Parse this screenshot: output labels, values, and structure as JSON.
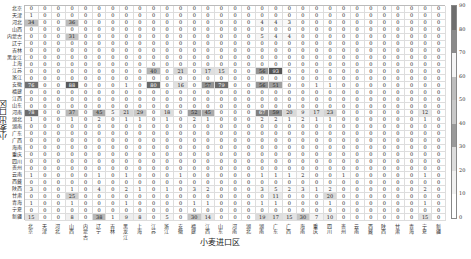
{
  "chart_data": {
    "type": "heatmap",
    "title": "",
    "xlabel": "小麦进口区",
    "ylabel": "小麦出口区",
    "provinces": [
      "北京",
      "天津",
      "河北",
      "山西",
      "内蒙古",
      "辽宁",
      "吉林",
      "黑龙江",
      "上海",
      "江苏",
      "浙江",
      "安徽",
      "福建",
      "江西",
      "山东",
      "河南",
      "湖北",
      "湖南",
      "广东",
      "广西",
      "海南",
      "重庆",
      "四川",
      "贵州",
      "云南",
      "西藏",
      "陕西",
      "甘肃",
      "青海",
      "宁夏",
      "新疆"
    ],
    "x_categories": [
      "北京",
      "天津",
      "河北",
      "山西",
      "内蒙古",
      "辽宁",
      "吉林",
      "黑龙江",
      "上海",
      "江苏",
      "浙江",
      "安徽",
      "福建",
      "江西",
      "山东",
      "河南",
      "湖北",
      "湖南",
      "广东",
      "广西",
      "海南",
      "重庆",
      "四川",
      "贵州",
      "云南",
      "西藏",
      "陕西",
      "甘肃",
      "青海",
      "宁夏",
      "新疆"
    ],
    "y_categories": [
      "北京",
      "天津",
      "河北",
      "山西",
      "内蒙古",
      "辽宁",
      "吉林",
      "黑龙江",
      "上海",
      "江苏",
      "浙江",
      "安徽",
      "福建",
      "江西",
      "山东",
      "河南",
      "湖北",
      "湖南",
      "广东",
      "广西",
      "海南",
      "重庆",
      "四川",
      "贵州",
      "云南",
      "西藏",
      "陕西",
      "甘肃",
      "青海",
      "宁夏",
      "新疆"
    ],
    "colorbar": {
      "min": 0,
      "max": 90,
      "ticks": [
        0,
        10,
        20,
        30,
        40,
        50,
        60,
        70,
        80,
        90
      ]
    },
    "values": [
      [
        0,
        0,
        0,
        0,
        0,
        0,
        0,
        0,
        0,
        0,
        0,
        0,
        0,
        0,
        0,
        0,
        0,
        0,
        0,
        0,
        0,
        0,
        0,
        0,
        0,
        0,
        0,
        0,
        0,
        0,
        0
      ],
      [
        1,
        0,
        0,
        0,
        0,
        0,
        0,
        0,
        0,
        0,
        0,
        0,
        0,
        0,
        0,
        0,
        0,
        0,
        0,
        0,
        0,
        0,
        0,
        0,
        0,
        0,
        0,
        0,
        0,
        0,
        0
      ],
      [
        34,
        0,
        0,
        36,
        0,
        0,
        0,
        0,
        0,
        0,
        0,
        0,
        0,
        0,
        0,
        0,
        0,
        4,
        4,
        3,
        0,
        0,
        0,
        0,
        0,
        0,
        0,
        0,
        0,
        0,
        0
      ],
      [
        0,
        0,
        0,
        0,
        0,
        0,
        0,
        0,
        0,
        0,
        0,
        0,
        0,
        0,
        0,
        0,
        0,
        0,
        0,
        0,
        0,
        0,
        0,
        0,
        0,
        0,
        0,
        0,
        0,
        0,
        0
      ],
      [
        0,
        0,
        0,
        31,
        0,
        0,
        0,
        0,
        0,
        0,
        0,
        0,
        0,
        0,
        0,
        0,
        0,
        5,
        4,
        4,
        0,
        0,
        0,
        0,
        0,
        0,
        0,
        0,
        0,
        0,
        0
      ],
      [
        0,
        0,
        0,
        0,
        0,
        0,
        0,
        0,
        0,
        0,
        0,
        0,
        0,
        0,
        0,
        0,
        0,
        0,
        0,
        0,
        0,
        0,
        0,
        0,
        0,
        0,
        0,
        0,
        0,
        0,
        0
      ],
      [
        0,
        0,
        0,
        0,
        0,
        0,
        0,
        0,
        0,
        0,
        0,
        0,
        0,
        0,
        0,
        0,
        0,
        0,
        0,
        0,
        0,
        0,
        0,
        0,
        0,
        0,
        0,
        0,
        0,
        0,
        0
      ],
      [
        0,
        0,
        0,
        0,
        0,
        0,
        0,
        0,
        0,
        0,
        0,
        0,
        0,
        0,
        0,
        0,
        0,
        0,
        0,
        0,
        0,
        0,
        0,
        0,
        0,
        0,
        0,
        0,
        0,
        0,
        0
      ],
      [
        0,
        0,
        0,
        0,
        0,
        0,
        0,
        0,
        0,
        0,
        0,
        0,
        0,
        0,
        0,
        0,
        0,
        0,
        0,
        0,
        0,
        0,
        0,
        0,
        0,
        0,
        0,
        0,
        0,
        0,
        0
      ],
      [
        0,
        0,
        0,
        0,
        0,
        0,
        0,
        0,
        0,
        40,
        0,
        21,
        0,
        17,
        15,
        0,
        0,
        56,
        93,
        0,
        0,
        0,
        0,
        0,
        0,
        0,
        0,
        0,
        0,
        0,
        0
      ],
      [
        0,
        0,
        0,
        0,
        0,
        0,
        0,
        0,
        0,
        0,
        0,
        0,
        0,
        0,
        0,
        0,
        0,
        0,
        0,
        0,
        0,
        0,
        0,
        0,
        0,
        0,
        0,
        0,
        0,
        0,
        0
      ],
      [
        76,
        0,
        0,
        88,
        0,
        0,
        0,
        1,
        0,
        80,
        0,
        16,
        0,
        57,
        79,
        0,
        0,
        56,
        51,
        0,
        0,
        1,
        1,
        0,
        0,
        0,
        0,
        0,
        0,
        0,
        0
      ],
      [
        0,
        0,
        0,
        0,
        0,
        0,
        0,
        0,
        0,
        0,
        0,
        0,
        0,
        0,
        0,
        0,
        0,
        0,
        0,
        0,
        0,
        0,
        0,
        0,
        0,
        0,
        0,
        0,
        0,
        0,
        0
      ],
      [
        0,
        0,
        0,
        0,
        0,
        0,
        0,
        0,
        0,
        0,
        0,
        0,
        0,
        0,
        0,
        0,
        0,
        0,
        0,
        0,
        0,
        0,
        0,
        0,
        0,
        0,
        0,
        0,
        0,
        0,
        0
      ],
      [
        0,
        0,
        0,
        0,
        0,
        0,
        0,
        0,
        0,
        0,
        0,
        0,
        0,
        0,
        0,
        0,
        0,
        0,
        0,
        0,
        0,
        0,
        0,
        0,
        0,
        0,
        0,
        0,
        0,
        0,
        0
      ],
      [
        78,
        0,
        0,
        37,
        0,
        45,
        5,
        21,
        29,
        0,
        18,
        0,
        52,
        45,
        0,
        0,
        0,
        67,
        59,
        20,
        9,
        17,
        23,
        0,
        0,
        0,
        0,
        0,
        0,
        12,
        0
      ],
      [
        1,
        0,
        0,
        1,
        0,
        2,
        0,
        1,
        1,
        0,
        1,
        0,
        2,
        1,
        0,
        0,
        0,
        2,
        2,
        1,
        2,
        1,
        1,
        0,
        0,
        0,
        0,
        0,
        0,
        1,
        0
      ],
      [
        0,
        0,
        0,
        0,
        0,
        0,
        0,
        0,
        0,
        0,
        0,
        0,
        0,
        0,
        0,
        0,
        0,
        0,
        0,
        0,
        0,
        0,
        0,
        0,
        0,
        0,
        0,
        0,
        0,
        0,
        0
      ],
      [
        0,
        0,
        0,
        0,
        0,
        0,
        0,
        0,
        0,
        0,
        0,
        0,
        0,
        0,
        0,
        0,
        0,
        0,
        0,
        0,
        0,
        0,
        0,
        0,
        0,
        0,
        0,
        0,
        0,
        0,
        0
      ],
      [
        0,
        0,
        0,
        0,
        0,
        0,
        0,
        0,
        0,
        0,
        0,
        0,
        0,
        0,
        0,
        0,
        0,
        0,
        0,
        0,
        0,
        0,
        0,
        0,
        0,
        0,
        0,
        0,
        0,
        0,
        0
      ],
      [
        0,
        0,
        0,
        0,
        0,
        0,
        0,
        0,
        0,
        0,
        0,
        0,
        0,
        0,
        0,
        0,
        0,
        0,
        0,
        0,
        0,
        0,
        0,
        0,
        0,
        0,
        0,
        0,
        0,
        0,
        0
      ],
      [
        0,
        0,
        0,
        0,
        0,
        0,
        0,
        0,
        0,
        0,
        0,
        0,
        0,
        0,
        0,
        0,
        0,
        0,
        0,
        0,
        0,
        0,
        0,
        0,
        0,
        0,
        0,
        0,
        0,
        0,
        0
      ],
      [
        0,
        0,
        0,
        0,
        0,
        0,
        0,
        0,
        0,
        0,
        0,
        0,
        0,
        0,
        0,
        0,
        0,
        0,
        0,
        0,
        0,
        0,
        0,
        0,
        0,
        0,
        0,
        0,
        0,
        0,
        0
      ],
      [
        0,
        0,
        0,
        0,
        0,
        0,
        0,
        0,
        0,
        0,
        0,
        0,
        0,
        0,
        0,
        0,
        0,
        0,
        0,
        0,
        0,
        0,
        0,
        0,
        0,
        0,
        0,
        0,
        0,
        0,
        0
      ],
      [
        1,
        0,
        0,
        0,
        0,
        1,
        0,
        1,
        0,
        0,
        0,
        1,
        0,
        0,
        0,
        0,
        0,
        1,
        1,
        1,
        2,
        0,
        0,
        1,
        0,
        0,
        0,
        0,
        0,
        1,
        0
      ],
      [
        0,
        0,
        0,
        0,
        0,
        0,
        0,
        0,
        0,
        0,
        0,
        0,
        0,
        0,
        0,
        0,
        0,
        0,
        0,
        0,
        0,
        0,
        0,
        0,
        0,
        0,
        0,
        0,
        0,
        0,
        0
      ],
      [
        3,
        0,
        0,
        1,
        0,
        4,
        0,
        2,
        1,
        0,
        1,
        0,
        3,
        2,
        0,
        0,
        0,
        3,
        5,
        2,
        3,
        1,
        2,
        0,
        0,
        0,
        0,
        0,
        0,
        2,
        0
      ],
      [
        0,
        0,
        0,
        25,
        0,
        0,
        0,
        0,
        0,
        0,
        0,
        0,
        0,
        0,
        0,
        0,
        0,
        0,
        11,
        0,
        0,
        0,
        20,
        0,
        0,
        0,
        0,
        0,
        0,
        0,
        0
      ],
      [
        1,
        0,
        0,
        1,
        0,
        0,
        0,
        1,
        0,
        0,
        0,
        0,
        1,
        1,
        0,
        0,
        0,
        1,
        1,
        0,
        0,
        0,
        1,
        0,
        0,
        0,
        0,
        0,
        0,
        1,
        0
      ],
      [
        0,
        0,
        0,
        0,
        0,
        0,
        0,
        0,
        0,
        0,
        0,
        0,
        0,
        0,
        0,
        0,
        0,
        0,
        0,
        0,
        0,
        0,
        0,
        0,
        0,
        0,
        0,
        0,
        0,
        0,
        0
      ],
      [
        15,
        0,
        0,
        8,
        0,
        38,
        1,
        9,
        8,
        0,
        5,
        0,
        30,
        14,
        0,
        0,
        0,
        19,
        17,
        15,
        30,
        7,
        10,
        0,
        0,
        0,
        0,
        0,
        0,
        15,
        0
      ]
    ],
    "grid": true,
    "legend_position": "right colorbar"
  }
}
